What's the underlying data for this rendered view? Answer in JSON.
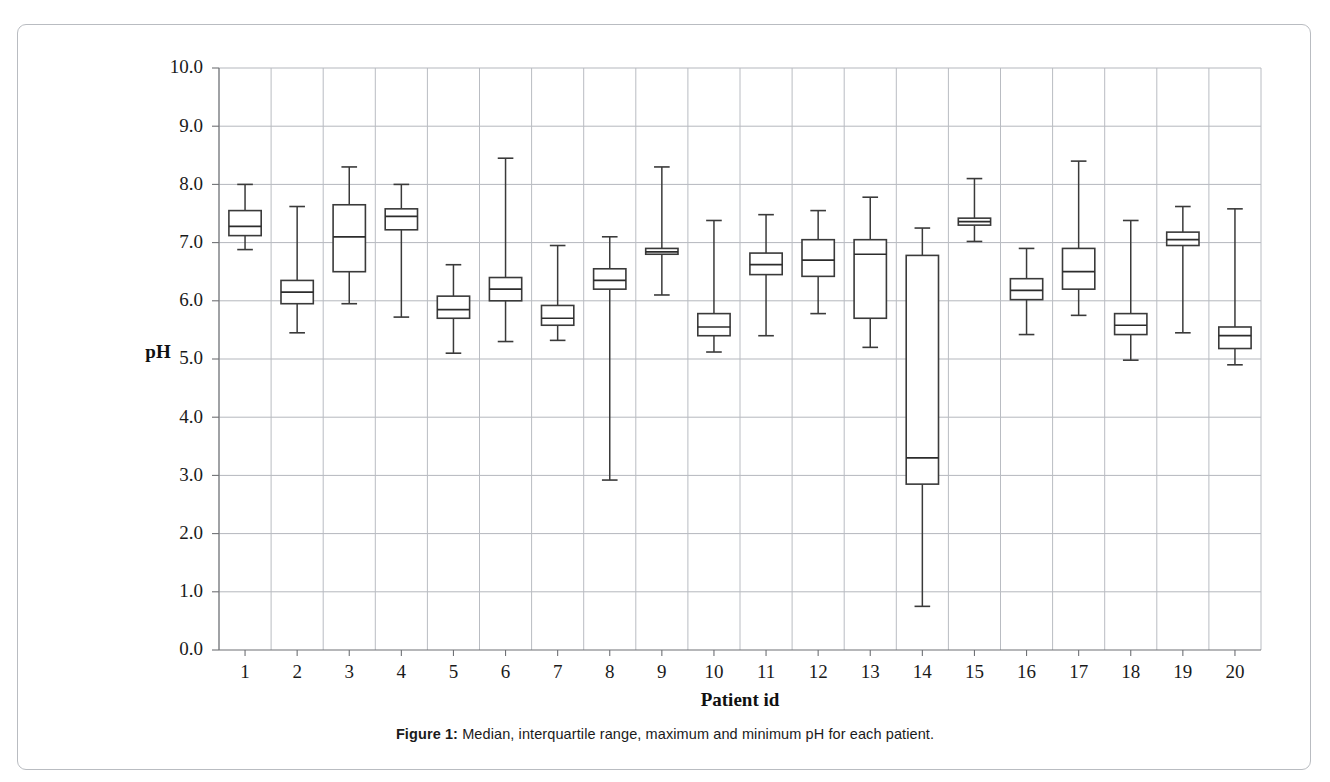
{
  "figure": {
    "caption_label": "Figure 1:",
    "caption_text": " Median, interquartile range, maximum and minimum pH for each patient.",
    "top_bleed_text": ""
  },
  "chart_data": {
    "type": "box",
    "title": "",
    "xlabel": "Patient id",
    "ylabel": "pH",
    "ylim": [
      0.0,
      10.0
    ],
    "ytick_step": 1.0,
    "ytick_labels": [
      "0.0",
      "1.0",
      "2.0",
      "3.0",
      "4.0",
      "5.0",
      "6.0",
      "7.0",
      "8.0",
      "9.0",
      "10.0"
    ],
    "grid": "horizontal-and-vertical",
    "legend": "none",
    "categories": [
      "1",
      "2",
      "3",
      "4",
      "5",
      "6",
      "7",
      "8",
      "9",
      "10",
      "11",
      "12",
      "13",
      "14",
      "15",
      "16",
      "17",
      "18",
      "19",
      "20"
    ],
    "boxes": [
      {
        "label": "1",
        "min": 6.88,
        "q1": 7.12,
        "median": 7.28,
        "q3": 7.55,
        "max": 8.0
      },
      {
        "label": "2",
        "min": 5.45,
        "q1": 5.95,
        "median": 6.15,
        "q3": 6.35,
        "max": 7.62
      },
      {
        "label": "3",
        "min": 5.95,
        "q1": 6.5,
        "median": 7.1,
        "q3": 7.65,
        "max": 8.3
      },
      {
        "label": "4",
        "min": 5.72,
        "q1": 7.22,
        "median": 7.45,
        "q3": 7.58,
        "max": 8.0
      },
      {
        "label": "5",
        "min": 5.1,
        "q1": 5.7,
        "median": 5.85,
        "q3": 6.08,
        "max": 6.62
      },
      {
        "label": "6",
        "min": 5.3,
        "q1": 6.0,
        "median": 6.2,
        "q3": 6.4,
        "max": 8.45
      },
      {
        "label": "7",
        "min": 5.32,
        "q1": 5.58,
        "median": 5.7,
        "q3": 5.92,
        "max": 6.95
      },
      {
        "label": "8",
        "min": 2.92,
        "q1": 6.2,
        "median": 6.35,
        "q3": 6.55,
        "max": 7.1
      },
      {
        "label": "9",
        "min": 6.1,
        "q1": 6.8,
        "median": 6.84,
        "q3": 6.9,
        "max": 8.3
      },
      {
        "label": "10",
        "min": 5.12,
        "q1": 5.4,
        "median": 5.55,
        "q3": 5.78,
        "max": 7.38
      },
      {
        "label": "11",
        "min": 5.4,
        "q1": 6.45,
        "median": 6.62,
        "q3": 6.82,
        "max": 7.48
      },
      {
        "label": "12",
        "min": 5.78,
        "q1": 6.42,
        "median": 6.7,
        "q3": 7.05,
        "max": 7.55
      },
      {
        "label": "13",
        "min": 5.2,
        "q1": 5.7,
        "median": 6.8,
        "q3": 7.05,
        "max": 7.78
      },
      {
        "label": "14",
        "min": 0.75,
        "q1": 2.85,
        "median": 3.3,
        "q3": 6.78,
        "max": 7.25
      },
      {
        "label": "15",
        "min": 7.02,
        "q1": 7.3,
        "median": 7.36,
        "q3": 7.42,
        "max": 8.1
      },
      {
        "label": "16",
        "min": 5.42,
        "q1": 6.02,
        "median": 6.18,
        "q3": 6.38,
        "max": 6.9
      },
      {
        "label": "17",
        "min": 5.75,
        "q1": 6.2,
        "median": 6.5,
        "q3": 6.9,
        "max": 8.4
      },
      {
        "label": "18",
        "min": 4.98,
        "q1": 5.42,
        "median": 5.58,
        "q3": 5.78,
        "max": 7.38
      },
      {
        "label": "19",
        "min": 5.45,
        "q1": 6.95,
        "median": 7.05,
        "q3": 7.18,
        "max": 7.62
      },
      {
        "label": "20",
        "min": 4.9,
        "q1": 5.18,
        "median": 5.4,
        "q3": 5.55,
        "max": 7.58
      }
    ]
  }
}
